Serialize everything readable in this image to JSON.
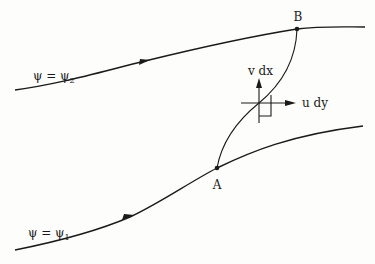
{
  "diagram": {
    "type": "streamline-flow-diagram",
    "streamlines": [
      {
        "id": "upper",
        "label_left": "ψ = ψ",
        "label_sub": "2",
        "direction": "left-to-right"
      },
      {
        "id": "lower",
        "label_left": "ψ = ψ",
        "label_sub": "1",
        "direction": "left-to-right"
      }
    ],
    "points": [
      {
        "id": "A",
        "label": "A",
        "on": "lower"
      },
      {
        "id": "B",
        "label": "B",
        "on": "upper"
      }
    ],
    "vectors": [
      {
        "id": "vertical",
        "label": "v dx"
      },
      {
        "id": "horizontal",
        "label": "u dy"
      }
    ],
    "colors": {
      "ink": "#1a1a1a",
      "paper": "#fdfdfb"
    }
  }
}
